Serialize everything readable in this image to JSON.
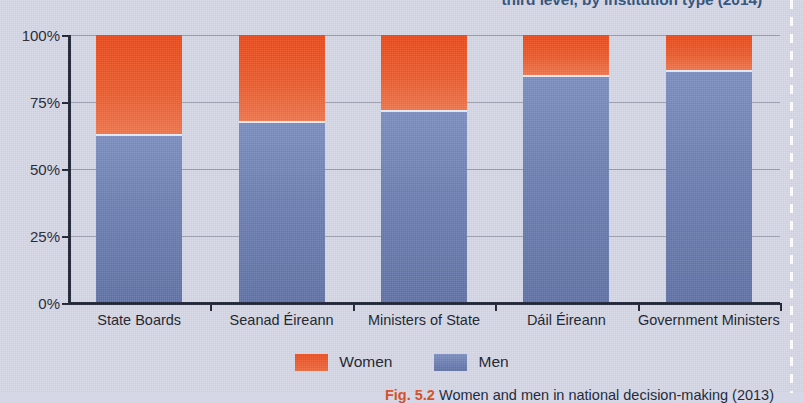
{
  "figure": {
    "top_title_fragment": "third level, by institution type (2014)",
    "caption_number": "Fig. 5.2",
    "caption_text": "Women and men in national decision-making (2013)"
  },
  "legend": {
    "items": [
      {
        "label": "Women",
        "color": "#ef4d1d",
        "key": "women"
      },
      {
        "label": "Men",
        "color": "#6c7fb3",
        "key": "men"
      }
    ]
  },
  "chart_data": {
    "type": "bar",
    "stacked": true,
    "title": "third level, by institution type (2014)",
    "xlabel": "",
    "ylabel": "",
    "ylim": [
      0,
      100
    ],
    "yticks": [
      "0%",
      "25%",
      "50%",
      "75%",
      "100%"
    ],
    "ytick_values": [
      0,
      25,
      50,
      75,
      100
    ],
    "grid": true,
    "legend_position": "bottom-center",
    "categories": [
      "State Boards",
      "Seanad Éireann",
      "Ministers of State",
      "Dáil Éireann",
      "Government Ministers"
    ],
    "series": [
      {
        "name": "Men",
        "color": "#6c7fb3",
        "values": [
          63,
          68,
          72,
          85,
          87
        ]
      },
      {
        "name": "Women",
        "color": "#ef4d1d",
        "values": [
          37,
          32,
          28,
          15,
          13
        ]
      }
    ]
  }
}
